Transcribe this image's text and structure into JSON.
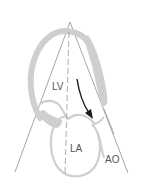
{
  "diagram": {
    "labels": {
      "lv": "LV",
      "la": "LA",
      "ao": "AO"
    },
    "colors": {
      "background": "#ffffff",
      "wall": "#cfcfcf",
      "sector_line": "#8a8a8a",
      "dashed_axis": "#9a9a9a",
      "arrow": "#1a1a1a",
      "label": "#555555"
    },
    "elements": [
      {
        "name": "scan-sector",
        "description": "Ultrasound sector lines from transducer apex"
      },
      {
        "name": "lv-wall",
        "description": "Left ventricle wall (thick grey arc)"
      },
      {
        "name": "la-chamber",
        "description": "Left atrium outline"
      },
      {
        "name": "aortic-root",
        "description": "Aorta outline on right"
      },
      {
        "name": "center-axis",
        "description": "Dashed long-axis line"
      },
      {
        "name": "flow-arrow",
        "description": "Black arrow showing flow toward LVOT/aorta"
      }
    ]
  }
}
